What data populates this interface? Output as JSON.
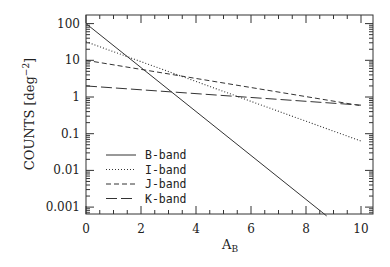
{
  "chart_data": {
    "type": "line",
    "title": "",
    "xlabel": "A",
    "xlabel_sub": "B",
    "ylabel": "COUNTS [deg",
    "ylabel_sup": "−2",
    "ylabel_close": "]",
    "xlim": [
      0,
      10.45
    ],
    "ylim": [
      0.00065,
      150
    ],
    "yscale": "log",
    "grid": false,
    "legend_position": "lower left",
    "x_ticks": [
      0,
      2,
      4,
      6,
      8,
      10
    ],
    "x_tick_labels": [
      "0",
      "2",
      "4",
      "6",
      "8",
      "10"
    ],
    "y_ticks": [
      100,
      10,
      1,
      0.1,
      0.01,
      0.001
    ],
    "y_tick_labels": [
      "100",
      "10",
      "1",
      "0.1",
      "0.01",
      "0.001"
    ],
    "series": [
      {
        "name": "B-band",
        "style": "solid",
        "x": [
          0,
          8.75
        ],
        "values": [
          100,
          0.000575
        ]
      },
      {
        "name": "I-band",
        "style": "dotted",
        "x": [
          0,
          10
        ],
        "values": [
          32,
          0.063
        ]
      },
      {
        "name": "J-band",
        "style": "short-dash",
        "x": [
          0,
          10
        ],
        "values": [
          10,
          0.58
        ]
      },
      {
        "name": "K-band",
        "style": "long-dash",
        "x": [
          0,
          10
        ],
        "values": [
          2,
          0.6
        ]
      }
    ]
  }
}
